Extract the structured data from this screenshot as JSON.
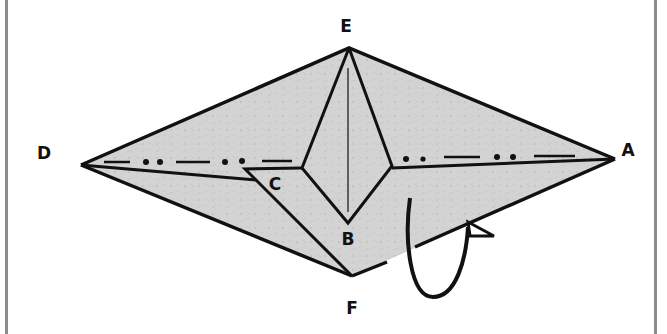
{
  "figure": {
    "type": "origami-fold-diagram",
    "colors": {
      "paper": "#d3d3d3",
      "paper_speckle": "#a9a9a9",
      "line": "#111111",
      "border": "#8c8c8c",
      "background": "#ffffff"
    }
  },
  "labels": {
    "E": "E",
    "D": "D",
    "A": "A",
    "C": "C",
    "B": "B",
    "F": "F"
  },
  "points": {
    "E": [
      349,
      48
    ],
    "D": [
      81,
      165
    ],
    "A": [
      615,
      159
    ],
    "F": [
      352,
      276
    ],
    "B": [
      348,
      223
    ],
    "C_tip": [
      245,
      169
    ],
    "diamond_left": [
      302,
      168
    ],
    "diamond_right": [
      392,
      166
    ]
  },
  "legend": {
    "mountain_fold": "dash-dot-dot line",
    "arrow": "tuck / fold under"
  }
}
